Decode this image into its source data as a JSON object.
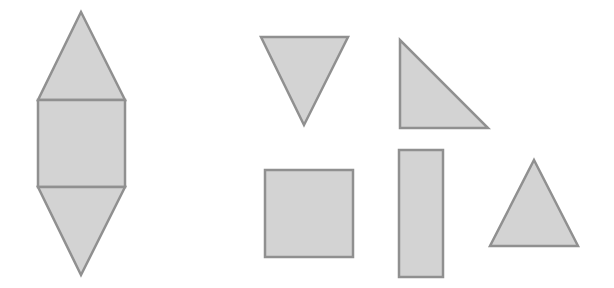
{
  "figure": {
    "width": 614,
    "height": 288,
    "background": "#ffffff",
    "fill": "#d3d3d3",
    "stroke": "#909090",
    "stroke_width": 2.5
  },
  "net": {
    "name": "triangular-prism-net",
    "top_triangle": "81,12 125,100 38,100",
    "square": {
      "x": 38,
      "y": 100,
      "w": 87,
      "h": 87
    },
    "bottom_triangle": "38,187 125,187 81,275"
  },
  "shapes": [
    {
      "name": "inverted-triangle",
      "type": "polygon",
      "points": "261,37 348,37 304,125"
    },
    {
      "name": "right-triangle",
      "type": "polygon",
      "points": "400,40 400,128 488,128"
    },
    {
      "name": "square",
      "type": "rect",
      "x": 265,
      "y": 170,
      "w": 88,
      "h": 87
    },
    {
      "name": "tall-rectangle",
      "type": "rect",
      "x": 399,
      "y": 150,
      "w": 44,
      "h": 127
    },
    {
      "name": "upright-triangle",
      "type": "polygon",
      "points": "534,160 578,246 490,246"
    }
  ]
}
